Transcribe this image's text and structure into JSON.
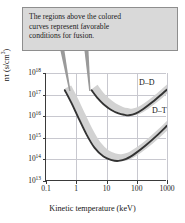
{
  "callout": {
    "name": "annotation-callout",
    "lines": [
      "The regions above the colored",
      "curves represent favorable",
      "conditions for fusion."
    ],
    "bg_color": "#d9d9d9",
    "border_color": "#8e8e8e"
  },
  "axes": {
    "x_title": "Kinetic temperature  (keV)",
    "y_title_prefix": "nτ  (s/cm",
    "y_title_sup": "3",
    "y_title_suffix": ")"
  },
  "chart_data": {
    "type": "line",
    "title": "",
    "subtitle": "",
    "xlabel": "Kinetic temperature (keV)",
    "ylabel": "nτ (s/cm^3)",
    "xscale": "log",
    "yscale": "log",
    "xlim": [
      0.1,
      1000
    ],
    "ylim": [
      10000000000000.0,
      1e+18
    ],
    "grid": true,
    "legend": "inline-labels",
    "x_ticks": [
      {
        "value": 0.1,
        "label": "0.1"
      },
      {
        "value": 1,
        "label": "1"
      },
      {
        "value": 10,
        "label": "10"
      },
      {
        "value": 100,
        "label": "100"
      },
      {
        "value": 1000,
        "label": "1000"
      }
    ],
    "y_ticks": [
      {
        "exp": "13",
        "mantissa": "10",
        "value": 10000000000000.0
      },
      {
        "exp": "14",
        "mantissa": "10",
        "value": 100000000000000.0
      },
      {
        "exp": "15",
        "mantissa": "10",
        "value": 1000000000000000.0
      },
      {
        "exp": "16",
        "mantissa": "10",
        "value": 1e+16
      },
      {
        "exp": "17",
        "mantissa": "10",
        "value": 1e+17
      },
      {
        "exp": "18",
        "mantissa": "10",
        "value": 1e+18
      }
    ],
    "series": [
      {
        "name": "D–D",
        "label": "D–D",
        "band_color": "#d2d2d2",
        "line_color": "#333333",
        "minimum": {
          "x": 55,
          "y": 1.1e+16
        },
        "points": [
          {
            "x": 3.2,
            "y": 1.6e+17
          },
          {
            "x": 5,
            "y": 7e+16
          },
          {
            "x": 8,
            "y": 3.6e+16
          },
          {
            "x": 14,
            "y": 2e+16
          },
          {
            "x": 25,
            "y": 1.35e+16
          },
          {
            "x": 40,
            "y": 1.15e+16
          },
          {
            "x": 55,
            "y": 1.1e+16
          },
          {
            "x": 90,
            "y": 1.3e+16
          },
          {
            "x": 160,
            "y": 2.1e+16
          },
          {
            "x": 330,
            "y": 4.5e+16
          },
          {
            "x": 700,
            "y": 1.1e+17
          },
          {
            "x": 1000,
            "y": 1.7e+17
          }
        ]
      },
      {
        "name": "D–T",
        "label": "D–T",
        "band_color": "#d2d2d2",
        "line_color": "#333333",
        "minimum": {
          "x": 25,
          "y": 85000000000000.0
        },
        "points": [
          {
            "x": 0.42,
            "y": 1.6e+17
          },
          {
            "x": 0.7,
            "y": 4e+16
          },
          {
            "x": 1.2,
            "y": 8000000000000000.0
          },
          {
            "x": 2.2,
            "y": 1400000000000000.0
          },
          {
            "x": 4,
            "y": 350000000000000.0
          },
          {
            "x": 8,
            "y": 135000000000000.0
          },
          {
            "x": 15,
            "y": 92000000000000.0
          },
          {
            "x": 25,
            "y": 85000000000000.0
          },
          {
            "x": 45,
            "y": 105000000000000.0
          },
          {
            "x": 90,
            "y": 190000000000000.0
          },
          {
            "x": 200,
            "y": 450000000000000.0
          },
          {
            "x": 500,
            "y": 1400000000000000.0
          },
          {
            "x": 1000,
            "y": 3600000000000000.0
          }
        ]
      }
    ]
  }
}
